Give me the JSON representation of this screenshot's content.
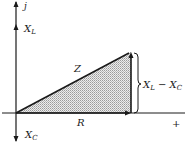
{
  "diagram": {
    "type": "impedance-phasor-triangle",
    "axes": {
      "vertical_label": "j",
      "horizontal_label": "+",
      "positive_vertical_marker": {
        "base": "X",
        "sub": "L"
      },
      "negative_vertical_marker": {
        "base": "X",
        "sub": "C"
      }
    },
    "triangle": {
      "hypotenuse_label": "Z",
      "base_label": "R",
      "height_label": {
        "text_a": "X",
        "sub_a": "L",
        "op": " − ",
        "text_b": "X",
        "sub_b": "C"
      }
    },
    "colors": {
      "stroke": "#1a1a1a",
      "fill_pattern": "#9a9a9a",
      "background": "#ffffff"
    }
  }
}
